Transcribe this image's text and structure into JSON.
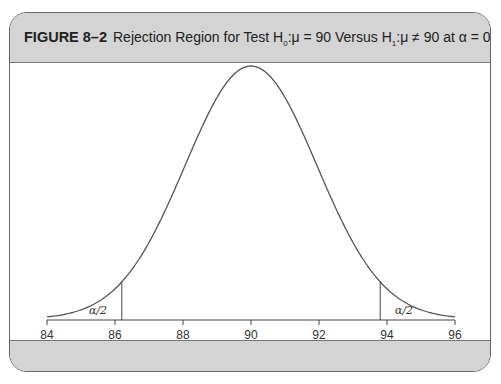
{
  "figure": {
    "label": "FIGURE 8–2",
    "caption_prefix": "Rejection Region for Test H",
    "h0_sub": "0",
    "caption_mid1": ":μ = 90 Versus H",
    "h1_sub": "1",
    "caption_mid2": ":μ ≠ 90 at α = 0.05"
  },
  "colors": {
    "header_bg": "#d4d4d4",
    "curve": "#555555",
    "border": "#666666"
  },
  "chart_data": {
    "type": "line",
    "xlabel": "",
    "ylabel": "",
    "distribution": "normal",
    "mean": 90,
    "sd": 1.94,
    "xlim": [
      84,
      96
    ],
    "x_ticks": [
      84,
      86,
      88,
      90,
      92,
      94,
      96
    ],
    "x_tick_labels": [
      "84",
      "86",
      "88",
      "90",
      "92",
      "94",
      "96"
    ],
    "critical_values": [
      86.2,
      93.8
    ],
    "alpha": 0.05,
    "annotations": [
      {
        "text": "α/2",
        "x": 85.5,
        "region": "left tail"
      },
      {
        "text": "α/2",
        "x": 94.5,
        "region": "right tail"
      }
    ],
    "grid": false,
    "legend": null
  }
}
